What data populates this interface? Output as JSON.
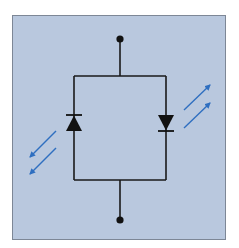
{
  "diagram": {
    "type": "circuit-schematic",
    "colors": {
      "page_background": "#ffffff",
      "panel_fill": "#b9c8de",
      "panel_border": "#7d8796",
      "wire": "#1a1a1a",
      "light_arrow": "#2f6fc0"
    },
    "components": [
      {
        "id": "terminal-top",
        "kind": "terminal"
      },
      {
        "id": "terminal-bottom",
        "kind": "terminal"
      },
      {
        "id": "diode-left",
        "kind": "photodiode",
        "orientation": "up",
        "light": "emitting-out"
      },
      {
        "id": "diode-right",
        "kind": "led",
        "orientation": "down",
        "light": "emitting-out"
      }
    ],
    "arrows": [
      {
        "id": "left-arrows",
        "direction": "down-left",
        "count": 2
      },
      {
        "id": "right-arrows",
        "direction": "up-right",
        "count": 2
      }
    ]
  }
}
